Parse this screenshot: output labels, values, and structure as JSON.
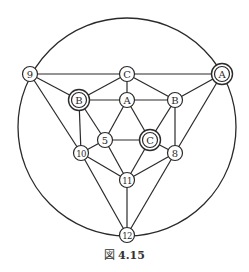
{
  "figure": {
    "caption_prefix": "図",
    "caption_number": "4.15",
    "stroke_color": "#2a2a2a",
    "outer_circle": {
      "cx": 127,
      "cy": 127,
      "r": 109
    },
    "nodes": [
      {
        "id": "n9",
        "label": "9",
        "x": 30,
        "y": 74,
        "double": false
      },
      {
        "id": "nCt",
        "label": "C",
        "x": 127,
        "y": 74,
        "double": false
      },
      {
        "id": "nAd",
        "label": "A",
        "x": 222,
        "y": 74,
        "double": true
      },
      {
        "id": "nBd",
        "label": "B",
        "x": 79,
        "y": 100,
        "double": true
      },
      {
        "id": "nAm",
        "label": "A",
        "x": 127,
        "y": 100,
        "double": false
      },
      {
        "id": "nBr",
        "label": "B",
        "x": 175,
        "y": 100,
        "double": false
      },
      {
        "id": "n5",
        "label": "5",
        "x": 105,
        "y": 140,
        "double": false
      },
      {
        "id": "nCd",
        "label": "C",
        "x": 150,
        "y": 140,
        "double": true
      },
      {
        "id": "n10",
        "label": "10",
        "x": 81,
        "y": 153,
        "double": false
      },
      {
        "id": "n8",
        "label": "8",
        "x": 175,
        "y": 153,
        "double": false
      },
      {
        "id": "n11",
        "label": "11",
        "x": 127,
        "y": 180,
        "double": false
      },
      {
        "id": "n12",
        "label": "12",
        "x": 127,
        "y": 235,
        "double": false
      }
    ],
    "edges": [
      [
        "n9",
        "nCt"
      ],
      [
        "nCt",
        "nAd"
      ],
      [
        "n9",
        "nBd"
      ],
      [
        "n9",
        "n10"
      ],
      [
        "nCt",
        "nBd"
      ],
      [
        "nCt",
        "nAm"
      ],
      [
        "nCt",
        "nBr"
      ],
      [
        "nBd",
        "nAm"
      ],
      [
        "nAm",
        "nBr"
      ],
      [
        "nAd",
        "nBr"
      ],
      [
        "nAd",
        "n8"
      ],
      [
        "nBd",
        "n10"
      ],
      [
        "nBd",
        "n5"
      ],
      [
        "nAm",
        "n5"
      ],
      [
        "nAm",
        "nCd"
      ],
      [
        "nBr",
        "nCd"
      ],
      [
        "nBr",
        "n8"
      ],
      [
        "n5",
        "nCd"
      ],
      [
        "n5",
        "n10"
      ],
      [
        "n5",
        "n11"
      ],
      [
        "nCd",
        "n11"
      ],
      [
        "nCd",
        "n8"
      ],
      [
        "n10",
        "n11"
      ],
      [
        "n8",
        "n11"
      ],
      [
        "n10",
        "n12"
      ],
      [
        "n11",
        "n12"
      ],
      [
        "n8",
        "n12"
      ]
    ]
  }
}
